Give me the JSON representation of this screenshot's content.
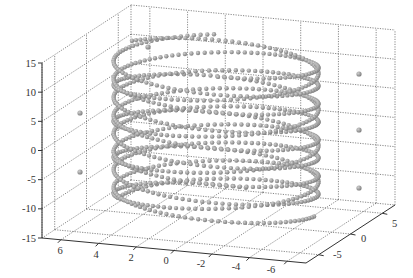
{
  "chart_data": {
    "type": "scatter3d",
    "title": "",
    "xlabel": "",
    "ylabel": "",
    "zlabel": "",
    "axes": {
      "x": {
        "ticks": [
          6,
          4,
          2,
          0,
          -2,
          -4,
          -6
        ],
        "range": [
          7,
          -7
        ]
      },
      "y": {
        "ticks": [
          -5,
          0,
          5
        ],
        "range": [
          -7,
          7
        ]
      },
      "z": {
        "ticks": [
          15,
          10,
          5,
          0,
          -5,
          -10,
          -15
        ],
        "range": [
          -15,
          15
        ]
      }
    },
    "grid": true,
    "legend": null,
    "series": [
      {
        "name": "helix-trajectories",
        "marker": "sphere",
        "color": "#8c8c8c",
        "coils": 5,
        "z_range": [
          -12,
          12
        ]
      },
      {
        "name": "isolated-points",
        "marker": "sphere",
        "color": "#8c8c8c",
        "points_2d_approx": [
          [
            148,
            47
          ],
          [
            80,
            113
          ],
          [
            80,
            172
          ],
          [
            359,
            74
          ],
          [
            359,
            130
          ],
          [
            359,
            188
          ]
        ]
      }
    ]
  },
  "labels": {
    "z_ticks": [
      "15",
      "10",
      "5",
      "0",
      "-5",
      "-10",
      "-15"
    ],
    "x_ticks": [
      "6",
      "4",
      "2",
      "0",
      "-2",
      "-4",
      "-6"
    ],
    "y_ticks": [
      "5",
      "0",
      "-5"
    ]
  },
  "colors": {
    "grid": "#444444",
    "axis": "#333333",
    "marker": "#8f8f8f",
    "marker_highlight": "#bdbdbd"
  }
}
